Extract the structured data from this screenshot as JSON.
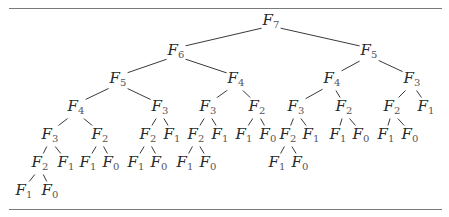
{
  "diagram": {
    "nodes": [
      {
        "id": "n0",
        "name": "F",
        "sub": "7",
        "x": 271,
        "y": 22
      },
      {
        "id": "n1",
        "name": "F",
        "sub": "6",
        "x": 176,
        "y": 52,
        "parent": "n0"
      },
      {
        "id": "n2",
        "name": "F",
        "sub": "5",
        "x": 369,
        "y": 52,
        "parent": "n0"
      },
      {
        "id": "n3",
        "name": "F",
        "sub": "5",
        "x": 118,
        "y": 80,
        "parent": "n1"
      },
      {
        "id": "n4",
        "name": "F",
        "sub": "4",
        "x": 236,
        "y": 80,
        "parent": "n1"
      },
      {
        "id": "n5",
        "name": "F",
        "sub": "4",
        "x": 332,
        "y": 80,
        "parent": "n2"
      },
      {
        "id": "n6",
        "name": "F",
        "sub": "3",
        "x": 412,
        "y": 80,
        "parent": "n2"
      },
      {
        "id": "n7",
        "name": "F",
        "sub": "4",
        "x": 76,
        "y": 108,
        "parent": "n3"
      },
      {
        "id": "n8",
        "name": "F",
        "sub": "3",
        "x": 160,
        "y": 108,
        "parent": "n3"
      },
      {
        "id": "n9",
        "name": "F",
        "sub": "3",
        "x": 208,
        "y": 108,
        "parent": "n4"
      },
      {
        "id": "n10",
        "name": "F",
        "sub": "2",
        "x": 257,
        "y": 108,
        "parent": "n4"
      },
      {
        "id": "n11",
        "name": "F",
        "sub": "3",
        "x": 296,
        "y": 108,
        "parent": "n5"
      },
      {
        "id": "n12",
        "name": "F",
        "sub": "2",
        "x": 344,
        "y": 108,
        "parent": "n5"
      },
      {
        "id": "n13",
        "name": "F",
        "sub": "2",
        "x": 392,
        "y": 108,
        "parent": "n6"
      },
      {
        "id": "n14",
        "name": "F",
        "sub": "1",
        "x": 426,
        "y": 108,
        "parent": "n6"
      },
      {
        "id": "n15",
        "name": "F",
        "sub": "3",
        "x": 50,
        "y": 136,
        "parent": "n7"
      },
      {
        "id": "n16",
        "name": "F",
        "sub": "2",
        "x": 100,
        "y": 136,
        "parent": "n7"
      },
      {
        "id": "n17",
        "name": "F",
        "sub": "2",
        "x": 148,
        "y": 136,
        "parent": "n8"
      },
      {
        "id": "n18",
        "name": "F",
        "sub": "1",
        "x": 172,
        "y": 136,
        "parent": "n8"
      },
      {
        "id": "n19",
        "name": "F",
        "sub": "2",
        "x": 196,
        "y": 136,
        "parent": "n9"
      },
      {
        "id": "n20",
        "name": "F",
        "sub": "1",
        "x": 220,
        "y": 136,
        "parent": "n9"
      },
      {
        "id": "n21",
        "name": "F",
        "sub": "1",
        "x": 244,
        "y": 136,
        "parent": "n10"
      },
      {
        "id": "n22",
        "name": "F",
        "sub": "0",
        "x": 268,
        "y": 136,
        "parent": "n10"
      },
      {
        "id": "n23",
        "name": "F",
        "sub": "2",
        "x": 288,
        "y": 136,
        "parent": "n11"
      },
      {
        "id": "n24",
        "name": "F",
        "sub": "1",
        "x": 311,
        "y": 136,
        "parent": "n11"
      },
      {
        "id": "n25",
        "name": "F",
        "sub": "1",
        "x": 338,
        "y": 136,
        "parent": "n12"
      },
      {
        "id": "n26",
        "name": "F",
        "sub": "0",
        "x": 361,
        "y": 136,
        "parent": "n12"
      },
      {
        "id": "n27",
        "name": "F",
        "sub": "1",
        "x": 386,
        "y": 136,
        "parent": "n13"
      },
      {
        "id": "n28",
        "name": "F",
        "sub": "0",
        "x": 410,
        "y": 136,
        "parent": "n13"
      },
      {
        "id": "n29",
        "name": "F",
        "sub": "2",
        "x": 40,
        "y": 164,
        "parent": "n15"
      },
      {
        "id": "n30",
        "name": "F",
        "sub": "1",
        "x": 66,
        "y": 164,
        "parent": "n15"
      },
      {
        "id": "n31",
        "name": "F",
        "sub": "1",
        "x": 88,
        "y": 164,
        "parent": "n16"
      },
      {
        "id": "n32",
        "name": "F",
        "sub": "0",
        "x": 111,
        "y": 164,
        "parent": "n16"
      },
      {
        "id": "n33",
        "name": "F",
        "sub": "1",
        "x": 136,
        "y": 164,
        "parent": "n17"
      },
      {
        "id": "n34",
        "name": "F",
        "sub": "0",
        "x": 159,
        "y": 164,
        "parent": "n17"
      },
      {
        "id": "n35",
        "name": "F",
        "sub": "1",
        "x": 185,
        "y": 164,
        "parent": "n19"
      },
      {
        "id": "n36",
        "name": "F",
        "sub": "0",
        "x": 208,
        "y": 164,
        "parent": "n19"
      },
      {
        "id": "n37",
        "name": "F",
        "sub": "1",
        "x": 277,
        "y": 164,
        "parent": "n23"
      },
      {
        "id": "n38",
        "name": "F",
        "sub": "0",
        "x": 300,
        "y": 164,
        "parent": "n23"
      },
      {
        "id": "n39",
        "name": "F",
        "sub": "1",
        "x": 24,
        "y": 192,
        "parent": "n29"
      },
      {
        "id": "n40",
        "name": "F",
        "sub": "0",
        "x": 50,
        "y": 192,
        "parent": "n29"
      }
    ],
    "colors": {
      "edge": "#3a3a3a",
      "text": "#2a2a2a",
      "rule": "#7a7a7a"
    }
  }
}
